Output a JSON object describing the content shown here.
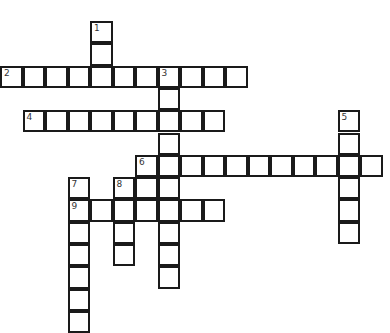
{
  "puzzle": {
    "type": "crossword",
    "cell_px": 22.5,
    "origin": {
      "x": 1,
      "y": 22
    },
    "entries": [
      {
        "number": "1",
        "direction": "down",
        "col": 4,
        "row": 0,
        "length": 3
      },
      {
        "number": "2",
        "direction": "across",
        "col": 0,
        "row": 2,
        "length": 11
      },
      {
        "number": "3",
        "direction": "down",
        "col": 7,
        "row": 2,
        "length": 10
      },
      {
        "number": "4",
        "direction": "across",
        "col": 1,
        "row": 4,
        "length": 9
      },
      {
        "number": "5",
        "direction": "down",
        "col": 15,
        "row": 4,
        "length": 6
      },
      {
        "number": "6",
        "direction": "across",
        "col": 6,
        "row": 6,
        "length": 11
      },
      {
        "number": "7",
        "direction": "down",
        "col": 3,
        "row": 7,
        "length": 7
      },
      {
        "number": "8",
        "direction": "down",
        "col": 5,
        "row": 7,
        "length": 4
      },
      {
        "number": "",
        "direction": "down",
        "col": 6,
        "row": 7,
        "length": 2
      },
      {
        "number": "9",
        "direction": "across",
        "col": 3,
        "row": 8,
        "length": 7
      }
    ]
  }
}
